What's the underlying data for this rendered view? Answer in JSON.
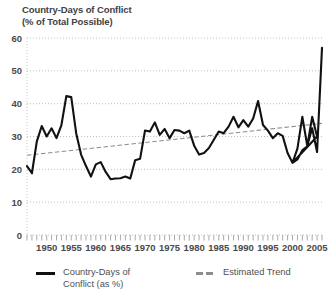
{
  "title": {
    "line1": "Country-Days of Conflict",
    "line2": "(% of Total Possible)"
  },
  "legend": {
    "series_label_line1": "Country-Days of",
    "series_label_line2": "Conflict (as %)",
    "trend_label": "Estimated Trend",
    "series_color": "#111111",
    "trend_color": "#8d8d8d"
  },
  "chart_data": {
    "type": "line",
    "title": "Country-Days of Conflict (% of Total Possible)",
    "xlabel": "",
    "ylabel": "",
    "xlim": [
      1946,
      2006
    ],
    "ylim": [
      0,
      60
    ],
    "yticks": [
      0,
      10,
      20,
      30,
      40,
      50,
      60
    ],
    "ytick_labels": [
      "0",
      "10",
      "20",
      "30",
      "40",
      "50",
      "60"
    ],
    "xticks": [
      1950,
      1955,
      1960,
      1965,
      1970,
      1975,
      1980,
      1985,
      1990,
      1995,
      2000,
      2005
    ],
    "xtick_labels": [
      "1950",
      "1955",
      "1960",
      "1965",
      "1970",
      "1975",
      "1980",
      "1985",
      "1990",
      "1995",
      "2000",
      "2005"
    ],
    "minor_xtick_interval": 1,
    "grid": "horizontal-dotted",
    "legend_position": "below",
    "x": [
      1946,
      1947,
      1948,
      1949,
      1950,
      1951,
      1952,
      1953,
      1954,
      1955,
      1956,
      1957,
      1958,
      1959,
      1960,
      1961,
      1962,
      1963,
      1964,
      1965,
      1966,
      1967,
      1968,
      1969,
      1970,
      1971,
      1972,
      1973,
      1974,
      1975,
      1976,
      1977,
      1978,
      1979,
      1980,
      1981,
      1982,
      1983,
      1984,
      1985,
      1986,
      1987,
      1988,
      1989,
      1990,
      1991,
      1992,
      1993,
      1994,
      1995,
      1996,
      1997,
      1998,
      1999,
      2000,
      2001,
      2002,
      2003,
      2004,
      2005
    ],
    "series": [
      {
        "name": "Country-Days of Conflict (as %)",
        "style": "solid",
        "color": "#111111",
        "values": [
          21.0,
          18.8,
          28.5,
          33.2,
          30.0,
          32.5,
          29.5,
          33.5,
          42.3,
          42.0,
          31.0,
          24.5,
          21.0,
          17.8,
          21.5,
          22.2,
          19.2,
          17.0,
          17.2,
          17.3,
          17.8,
          17.2,
          22.8,
          23.2,
          31.8,
          31.5,
          34.3,
          30.5,
          32.3,
          29.5,
          32.0,
          31.8,
          31.0,
          31.8,
          27.2,
          24.5,
          25.0,
          26.5,
          29.0,
          31.5,
          31.0,
          33.0,
          36.0,
          32.8,
          35.0,
          33.0,
          35.5,
          40.8,
          33.5,
          31.8,
          29.5,
          31.0,
          30.2,
          25.0,
          22.0,
          23.0,
          25.8,
          27.0,
          36.0,
          30.0
        ]
      },
      {
        "name": "Estimated Trend",
        "style": "dashed",
        "color": "#8d8d8d",
        "values_endpoints": [
          [
            1946,
            24.3
          ],
          [
            2006,
            34.0
          ]
        ]
      }
    ],
    "series_tail_note": [
      {
        "year": 2000,
        "value": 22.0
      },
      {
        "year": 2001,
        "value": 26.3
      },
      {
        "year": 2002,
        "value": 36.0
      },
      {
        "year": 2003,
        "value": 27.2
      },
      {
        "year": 2004,
        "value": 32.5
      },
      {
        "year": 2005,
        "value": 25.3
      },
      {
        "year": 2006,
        "value": 57.0
      }
    ]
  }
}
